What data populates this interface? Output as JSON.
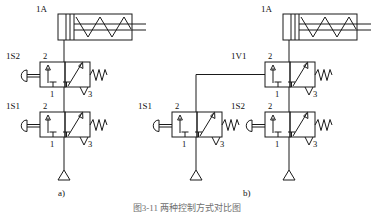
{
  "figure": {
    "title_caption": "图3-11  两种控制方式对比图",
    "subfigures": [
      {
        "id": "a",
        "label": "a)"
      },
      {
        "id": "b",
        "label": "b)"
      }
    ]
  },
  "ports": {
    "p1": "1",
    "p2": "2",
    "p3": "3"
  },
  "circuit_a": {
    "cylinder": {
      "tag": "1A",
      "type": "single-acting-spring-return-cylinder"
    },
    "valves": [
      {
        "tag": "1S2",
        "type": "3/2-way-valve-plunger-actuated-spring-return",
        "ports": {
          "p1": "1",
          "p2": "2",
          "p3": "3"
        }
      },
      {
        "tag": "1S1",
        "type": "3/2-way-valve-plunger-actuated-spring-return",
        "ports": {
          "p1": "1",
          "p2": "2",
          "p3": "3"
        }
      }
    ],
    "supply": {
      "type": "pressure-source-triangle"
    }
  },
  "circuit_b": {
    "cylinder": {
      "tag": "1A",
      "type": "single-acting-spring-return-cylinder"
    },
    "valves": [
      {
        "tag": "1V1",
        "type": "3/2-way-valve-pilot-operated-spring-return",
        "ports": {
          "p1": "1",
          "p2": "2",
          "p3": "3"
        }
      },
      {
        "tag": "1S1",
        "type": "3/2-way-valve-plunger-actuated-spring-return",
        "ports": {
          "p1": "1",
          "p2": "2",
          "p3": "3"
        }
      },
      {
        "tag": "1S2",
        "type": "3/2-way-valve-plunger-actuated-spring-return",
        "ports": {
          "p1": "1",
          "p2": "2",
          "p3": "3"
        }
      }
    ],
    "supplies": [
      {
        "type": "pressure-source-triangle"
      },
      {
        "type": "pressure-source-triangle"
      }
    ]
  }
}
